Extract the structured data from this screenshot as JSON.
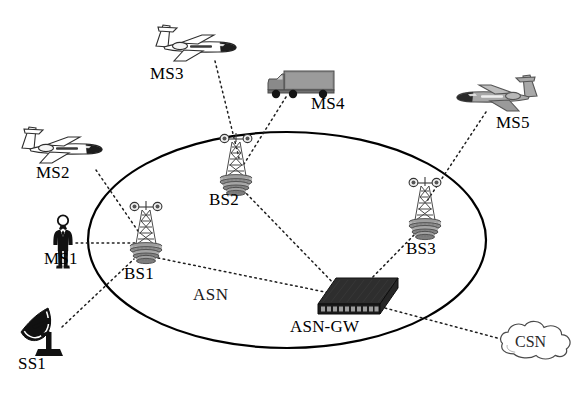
{
  "diagram": {
    "region": {
      "name": "ASN",
      "label": "ASN",
      "shape": "ellipse"
    },
    "nodes": [
      {
        "id": "MS1",
        "label": "MS1",
        "icon": "person-icon",
        "kind": "mobile-station",
        "x": 62,
        "y": 237,
        "label_x": 44,
        "label_y": 258
      },
      {
        "id": "MS2",
        "label": "MS2",
        "icon": "airplane-white-icon",
        "kind": "mobile-station",
        "x": 62,
        "y": 152,
        "label_x": 36,
        "label_y": 173
      },
      {
        "id": "MS3",
        "label": "MS3",
        "icon": "airplane-white-icon",
        "kind": "mobile-station",
        "x": 197,
        "y": 48,
        "label_x": 150,
        "label_y": 75
      },
      {
        "id": "MS4",
        "label": "MS4",
        "icon": "truck-icon",
        "kind": "mobile-station",
        "x": 299,
        "y": 83,
        "label_x": 311,
        "label_y": 101
      },
      {
        "id": "MS5",
        "label": "MS5",
        "icon": "airplane-gray-icon",
        "kind": "mobile-station",
        "x": 495,
        "y": 94,
        "label_x": 496,
        "label_y": 120
      },
      {
        "id": "SS1",
        "label": "SS1",
        "icon": "satellite-dish-icon",
        "kind": "subscriber-station",
        "x": 40,
        "y": 335,
        "label_x": 18,
        "label_y": 352
      },
      {
        "id": "BS1",
        "label": "BS1",
        "icon": "cell-tower-icon",
        "kind": "base-station",
        "x": 141,
        "y": 240,
        "label_x": 124,
        "label_y": 266
      },
      {
        "id": "BS2",
        "label": "BS2",
        "icon": "cell-tower-icon",
        "kind": "base-station",
        "x": 231,
        "y": 172,
        "label_x": 209,
        "label_y": 192
      },
      {
        "id": "BS3",
        "label": "BS3",
        "icon": "cell-tower-icon",
        "kind": "base-station",
        "x": 420,
        "y": 218,
        "label_x": 406,
        "label_y": 242
      },
      {
        "id": "ASN-GW",
        "label": "ASN-GW",
        "icon": "switch-box-icon",
        "kind": "gateway",
        "x": 350,
        "y": 296,
        "label_x": 290,
        "label_y": 319
      },
      {
        "id": "CSN",
        "label": "CSN",
        "icon": "cloud-icon",
        "kind": "core-network",
        "x": 535,
        "y": 345,
        "label_x": 514,
        "label_y": 338
      }
    ],
    "links": [
      {
        "from": "MS1",
        "to": "BS1",
        "style": "dotted"
      },
      {
        "from": "MS2",
        "to": "BS1",
        "style": "dotted"
      },
      {
        "from": "SS1",
        "to": "BS1",
        "style": "dotted"
      },
      {
        "from": "MS3",
        "to": "BS2",
        "style": "dotted"
      },
      {
        "from": "MS4",
        "to": "BS2",
        "style": "dotted"
      },
      {
        "from": "MS5",
        "to": "BS3",
        "style": "dotted"
      },
      {
        "from": "BS1",
        "to": "ASN-GW",
        "style": "dotted"
      },
      {
        "from": "BS2",
        "to": "ASN-GW",
        "style": "dotted"
      },
      {
        "from": "BS3",
        "to": "ASN-GW",
        "style": "dotted"
      },
      {
        "from": "ASN-GW",
        "to": "CSN",
        "style": "dotted"
      }
    ],
    "colors": {
      "background": "#ffffff",
      "line": "#1a1a1a",
      "ellipse_stroke": "#000000",
      "text": "#000000",
      "truck_body": "#8c8c8c",
      "jet_gray": "#9a9a9a",
      "switch_dark": "#262626"
    }
  }
}
